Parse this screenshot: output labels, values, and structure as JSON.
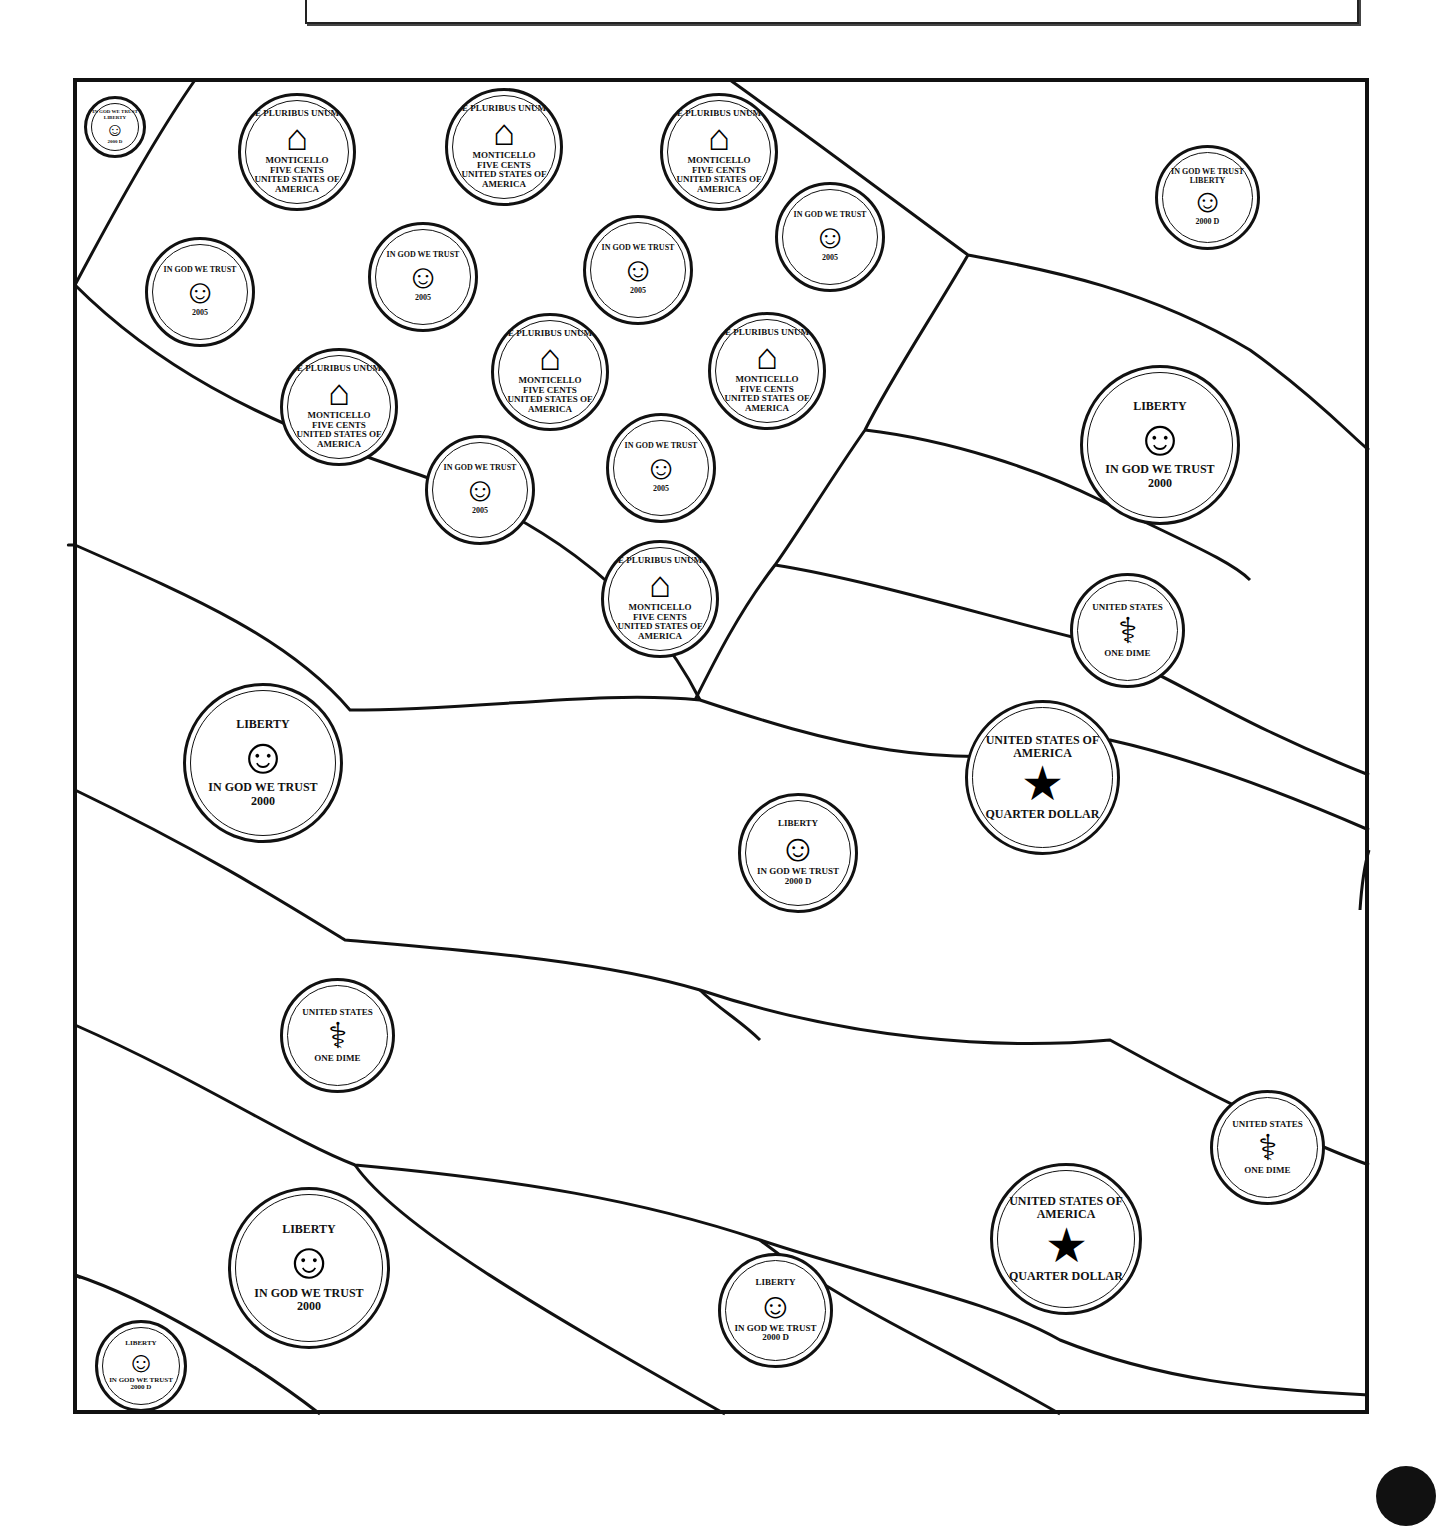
{
  "page": {
    "title_box_text": "",
    "page_number_badge": ""
  },
  "coin_types": {
    "penny": {
      "top": "IN GOD WE TRUST",
      "left": "LIBERTY",
      "year": "2000",
      "mint": "D",
      "glyph": "penny-lincoln-icon"
    },
    "nickel_front": {
      "left": "IN GOD WE TRUST",
      "right": "LIBERTY",
      "year": "2005",
      "glyph": "nickel-jefferson-icon"
    },
    "nickel_back": {
      "top": "E PLURIBUS UNUM",
      "mid": "MONTICELLO",
      "value": "FIVE CENTS",
      "bottom": "UNITED STATES OF AMERICA",
      "glyph": "monticello-icon"
    },
    "dime_front": {
      "left": "LIBERTY",
      "motto": "IN GOD WE TRUST",
      "year": "2000",
      "mint": "D",
      "glyph": "dime-roosevelt-icon"
    },
    "dime_back": {
      "top": "UNITED STATES",
      "bottom": "ONE DIME",
      "glyph": "torch-icon"
    },
    "quarter_front": {
      "top": "LIBERTY",
      "motto": "IN GOD WE TRUST",
      "year": "2000",
      "glyph": "quarter-washington-icon"
    },
    "quarter_back": {
      "top": "UNITED STATES OF AMERICA",
      "bottom": "QUARTER DOLLAR",
      "glyph": "eagle-icon"
    }
  },
  "coins": [
    {
      "type": "penny",
      "x": 84,
      "y": 96,
      "d": 62
    },
    {
      "type": "nickel_back",
      "x": 238,
      "y": 93,
      "d": 118
    },
    {
      "type": "nickel_back",
      "x": 445,
      "y": 88,
      "d": 118
    },
    {
      "type": "nickel_back",
      "x": 660,
      "y": 93,
      "d": 118
    },
    {
      "type": "penny",
      "x": 1155,
      "y": 145,
      "d": 105
    },
    {
      "type": "nickel_front",
      "x": 145,
      "y": 237,
      "d": 110
    },
    {
      "type": "nickel_front",
      "x": 368,
      "y": 222,
      "d": 110
    },
    {
      "type": "nickel_front",
      "x": 583,
      "y": 215,
      "d": 110
    },
    {
      "type": "nickel_front",
      "x": 775,
      "y": 182,
      "d": 110
    },
    {
      "type": "nickel_back",
      "x": 280,
      "y": 348,
      "d": 118
    },
    {
      "type": "nickel_back",
      "x": 491,
      "y": 313,
      "d": 118
    },
    {
      "type": "nickel_back",
      "x": 708,
      "y": 312,
      "d": 118
    },
    {
      "type": "quarter_front",
      "x": 1080,
      "y": 365,
      "d": 160
    },
    {
      "type": "nickel_front",
      "x": 425,
      "y": 435,
      "d": 110
    },
    {
      "type": "nickel_front",
      "x": 606,
      "y": 413,
      "d": 110
    },
    {
      "type": "nickel_back",
      "x": 601,
      "y": 540,
      "d": 118
    },
    {
      "type": "dime_back",
      "x": 1070,
      "y": 573,
      "d": 115
    },
    {
      "type": "quarter_front",
      "x": 183,
      "y": 683,
      "d": 160
    },
    {
      "type": "quarter_back",
      "x": 965,
      "y": 700,
      "d": 155
    },
    {
      "type": "dime_front",
      "x": 738,
      "y": 793,
      "d": 120
    },
    {
      "type": "dime_back",
      "x": 280,
      "y": 978,
      "d": 115
    },
    {
      "type": "dime_back",
      "x": 1210,
      "y": 1090,
      "d": 115
    },
    {
      "type": "quarter_back",
      "x": 990,
      "y": 1163,
      "d": 152
    },
    {
      "type": "quarter_front",
      "x": 228,
      "y": 1187,
      "d": 162
    },
    {
      "type": "dime_front",
      "x": 718,
      "y": 1253,
      "d": 115
    },
    {
      "type": "dime_front",
      "x": 95,
      "y": 1320,
      "d": 92
    }
  ]
}
